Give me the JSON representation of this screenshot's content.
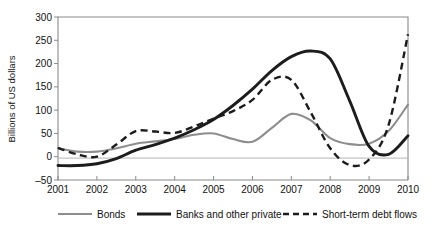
{
  "chart_data": {
    "type": "line",
    "title": "",
    "xlabel": "",
    "ylabel": "Billions of US dollars",
    "xlim": [
      2001,
      2010
    ],
    "ylim": [
      -50,
      300
    ],
    "yticks": [
      -50,
      0,
      50,
      100,
      150,
      200,
      250,
      300
    ],
    "ytick_labels": [
      "–50",
      "0",
      "50",
      "100",
      "150",
      "200",
      "250",
      "300"
    ],
    "xticks": [
      2001,
      2002,
      2003,
      2004,
      2005,
      2006,
      2007,
      2008,
      2009,
      2010
    ],
    "xtick_labels": [
      "2001",
      "2002",
      "2003",
      "2004",
      "2005",
      "2006",
      "2007",
      "2008",
      "2009",
      "2010"
    ],
    "grid": false,
    "zero_line": true,
    "legend_position": "bottom",
    "series": [
      {
        "name": "Bonds",
        "style": "solid",
        "color": "#8d8d8d",
        "x": [
          2001,
          2001.5,
          2002,
          2002.5,
          2003,
          2003.5,
          2004,
          2004.5,
          2005,
          2005.5,
          2006,
          2006.5,
          2007,
          2007.5,
          2008,
          2008.5,
          2009,
          2009.5,
          2010
        ],
        "values": [
          18,
          11,
          11,
          18,
          28,
          33,
          38,
          47,
          50,
          38,
          32,
          62,
          92,
          78,
          40,
          27,
          28,
          55,
          112
        ]
      },
      {
        "name": "Banks and other private",
        "style": "solid",
        "color": "#1c1c1c",
        "x": [
          2001,
          2001.5,
          2002,
          2002.5,
          2003,
          2003.5,
          2004,
          2004.5,
          2005,
          2005.5,
          2006,
          2006.5,
          2007,
          2007.5,
          2008,
          2008.5,
          2009,
          2009.5,
          2010
        ],
        "values": [
          -19,
          -19,
          -15,
          -4,
          14,
          26,
          40,
          58,
          80,
          110,
          145,
          185,
          215,
          227,
          210,
          120,
          22,
          5,
          45
        ]
      },
      {
        "name": "Short-term debt flows",
        "style": "dashed",
        "color": "#1c1c1c",
        "x": [
          2001,
          2001.5,
          2002,
          2002.5,
          2003,
          2003.5,
          2004,
          2004.5,
          2005,
          2005.5,
          2006,
          2006.5,
          2007,
          2007.5,
          2008,
          2008.5,
          2009,
          2009.5,
          2010
        ],
        "values": [
          19,
          5,
          0,
          26,
          55,
          54,
          51,
          65,
          82,
          98,
          122,
          165,
          165,
          95,
          18,
          -18,
          -6,
          68,
          263
        ]
      }
    ]
  },
  "axis": {
    "ylabel": "Billions of US dollars"
  },
  "legend": {
    "items": [
      {
        "label": "Bonds",
        "style": "solid-gray"
      },
      {
        "label": "Banks and other private",
        "style": "solid-black"
      },
      {
        "label": "Short-term debt flows",
        "style": "dashed-black"
      }
    ]
  }
}
